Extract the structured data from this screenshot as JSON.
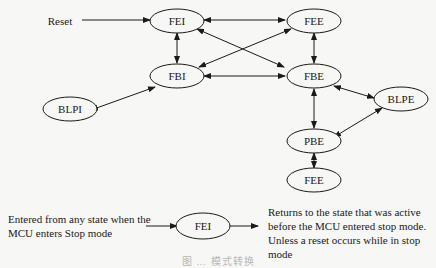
{
  "diagram": {
    "reset_label": "Reset",
    "nodes": {
      "fei": "FEI",
      "fee_top": "FEE",
      "fbi": "FBI",
      "fbe": "FBE",
      "blpi": "BLPI",
      "blpe": "BLPE",
      "pbe": "PBE",
      "fee_bottom": "FEE"
    },
    "edges": [
      {
        "from": "Reset",
        "to": "FEI",
        "direction": "one-way"
      },
      {
        "from": "FEI",
        "to": "FEE",
        "direction": "both"
      },
      {
        "from": "FEI",
        "to": "FBI",
        "direction": "both"
      },
      {
        "from": "FEI",
        "to": "FBE",
        "direction": "both"
      },
      {
        "from": "FEE",
        "to": "FBI",
        "direction": "both"
      },
      {
        "from": "FEE",
        "to": "FBE",
        "direction": "both"
      },
      {
        "from": "FBI",
        "to": "FBE",
        "direction": "both"
      },
      {
        "from": "FBI",
        "to": "BLPI",
        "direction": "both"
      },
      {
        "from": "FBE",
        "to": "BLPE",
        "direction": "both"
      },
      {
        "from": "FBE",
        "to": "PBE",
        "direction": "both"
      },
      {
        "from": "PBE",
        "to": "BLPE",
        "direction": "both"
      },
      {
        "from": "PBE",
        "to": "FEE",
        "direction": "both"
      }
    ],
    "stop_mode": {
      "entry_text_line1": "Entered from any state when the",
      "entry_text_line2": "MCU enters Stop mode",
      "node": "FEI",
      "exit_text_line1": "Returns to the state that was active",
      "exit_text_line2": "before the MCU entered stop mode.",
      "exit_text_line3": "Unless a reset occurs while in stop",
      "exit_text_line4": "mode"
    },
    "caption": "图 … 模式转换"
  }
}
